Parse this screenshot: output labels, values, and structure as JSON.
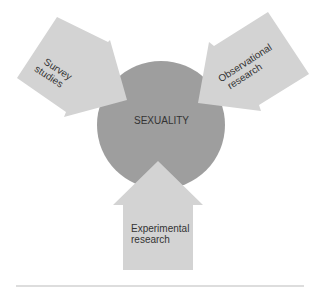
{
  "center": {
    "label": "SEXUALITY",
    "color": "#9e9e9e"
  },
  "arrows": [
    {
      "id": "survey",
      "line1": "Survey",
      "line2": "studies",
      "color": "#d2d2d2"
    },
    {
      "id": "observational",
      "line1": "Observational",
      "line2": "research",
      "color": "#d2d2d2"
    },
    {
      "id": "experimental",
      "line1": "Experimental",
      "line2": "research",
      "color": "#d2d2d2"
    }
  ]
}
